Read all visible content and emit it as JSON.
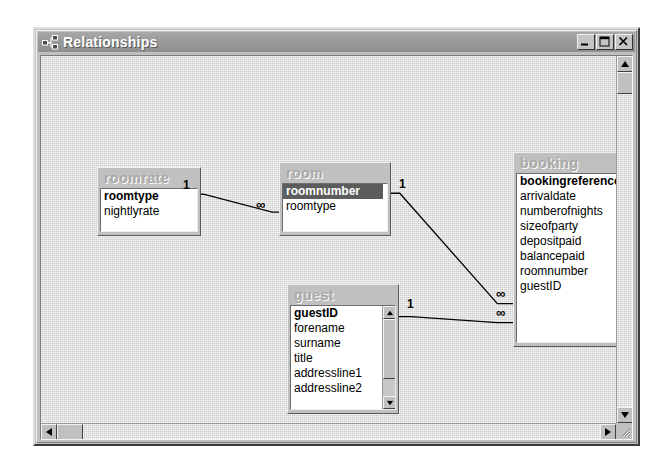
{
  "window": {
    "title": "Relationships",
    "icon": "relationships-icon",
    "buttons": [
      {
        "name": "minimize-button",
        "glyph": "minimize"
      },
      {
        "name": "maximize-button",
        "glyph": "maximize"
      },
      {
        "name": "close-button",
        "glyph": "close"
      }
    ]
  },
  "tables": [
    {
      "id": "roomrate",
      "title": "roomrate",
      "x": 56,
      "y": 111,
      "w": 104,
      "h": 69,
      "has_scrollbar": false,
      "fields": [
        {
          "label": "roomtype",
          "pk": true,
          "selected": false
        },
        {
          "label": "nightlyrate",
          "pk": false,
          "selected": false
        }
      ]
    },
    {
      "id": "room",
      "title": "room",
      "x": 238,
      "y": 106,
      "w": 112,
      "h": 74,
      "has_scrollbar": false,
      "fields": [
        {
          "label": "roomnumber",
          "pk": true,
          "selected": true
        },
        {
          "label": "roomtype",
          "pk": false,
          "selected": false
        }
      ]
    },
    {
      "id": "guest",
      "title": "guest",
      "x": 246,
      "y": 228,
      "w": 112,
      "h": 130,
      "has_scrollbar": true,
      "fields": [
        {
          "label": "guestID",
          "pk": true,
          "selected": false
        },
        {
          "label": "forename",
          "pk": false,
          "selected": false
        },
        {
          "label": "surname",
          "pk": false,
          "selected": false
        },
        {
          "label": "title",
          "pk": false,
          "selected": false
        },
        {
          "label": "addressline1",
          "pk": false,
          "selected": false
        },
        {
          "label": "addressline2",
          "pk": false,
          "selected": false
        }
      ]
    },
    {
      "id": "booking",
      "title": "booking",
      "x": 472,
      "y": 96,
      "w": 130,
      "h": 195,
      "has_scrollbar": false,
      "fields": [
        {
          "label": "bookingreference",
          "pk": true,
          "selected": false
        },
        {
          "label": "arrivaldate",
          "pk": false,
          "selected": false
        },
        {
          "label": "numberofnights",
          "pk": false,
          "selected": false
        },
        {
          "label": "sizeofparty",
          "pk": false,
          "selected": false
        },
        {
          "label": "depositpaid",
          "pk": false,
          "selected": false
        },
        {
          "label": "balancepaid",
          "pk": false,
          "selected": false
        },
        {
          "label": "roomnumber",
          "pk": false,
          "selected": false
        },
        {
          "label": "guestID",
          "pk": false,
          "selected": false
        }
      ]
    }
  ],
  "relationships": [
    {
      "id": "roomrate-room",
      "from_table": "roomrate",
      "from_field": "roomtype",
      "to_table": "room",
      "to_field": "roomtype",
      "from_cardinality": "1",
      "to_cardinality": "∞",
      "from_label_x": 142,
      "from_label_y": 124,
      "to_label_x": 215,
      "to_label_y": 143,
      "path": "M 126,139 L 163,139 L 232,157 L 241,157"
    },
    {
      "id": "room-booking",
      "from_table": "room",
      "from_field": "roomnumber",
      "to_table": "booking",
      "to_field": "roomnumber",
      "from_cardinality": "1",
      "to_cardinality": "∞",
      "from_label_x": 358,
      "from_label_y": 123,
      "to_label_x": 455,
      "to_label_y": 232,
      "path": "M 319,138 L 360,138 L 458,249 L 474,249"
    },
    {
      "id": "guest-booking",
      "from_table": "guest",
      "from_field": "guestID",
      "to_table": "booking",
      "to_field": "guestID",
      "from_cardinality": "1",
      "to_cardinality": "∞",
      "from_label_x": 366,
      "from_label_y": 243,
      "to_label_x": 455,
      "to_label_y": 251,
      "path": "M 330,262 L 371,262 L 458,268 L 474,268"
    }
  ],
  "scrollbars": {
    "vertical": {
      "name": "vertical-scrollbar",
      "up": "scroll-up-arrow",
      "down": "scroll-down-arrow"
    },
    "horizontal": {
      "name": "horizontal-scrollbar",
      "left": "scroll-left-arrow",
      "right": "scroll-right-arrow"
    },
    "resize_grip": "resize-grip"
  },
  "colors": {
    "titlebar": "#9a9a9a",
    "window_face": "#c0c0c0",
    "canvas": "#cccccc",
    "selected_field": "#5c5c5c",
    "table_title_text": "#a8a8a8"
  }
}
